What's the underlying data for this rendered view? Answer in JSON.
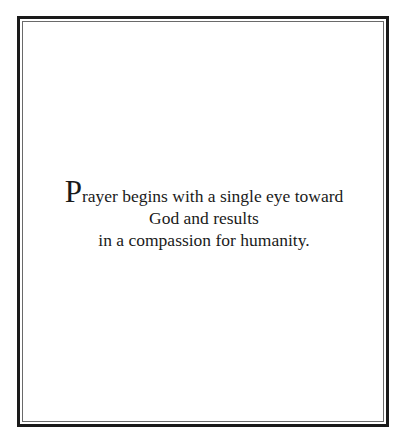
{
  "quote": {
    "initial": "P",
    "line1_rest": "rayer begins with a single eye toward",
    "line2": "God and results",
    "line3": "in a compassion for humanity."
  },
  "frame": {
    "outer_color": "#1a1a1a",
    "inner_color": "#6a6a6a"
  }
}
